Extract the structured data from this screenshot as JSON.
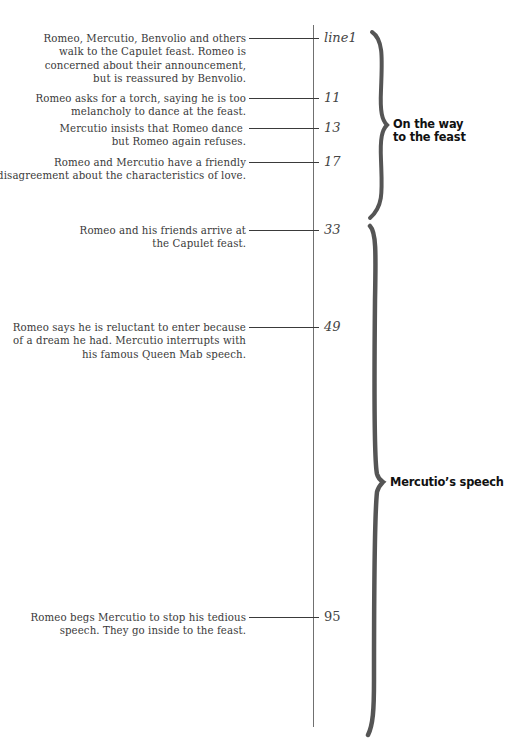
{
  "events": [
    {
      "line": "line1",
      "description": [
        "Romeo, Mercutio, Benvolio and others",
        "walk to the Capulet feast. Romeo is",
        "concerned about their announcement,",
        "but is reassured by Benvolio."
      ]
    },
    {
      "line": "11",
      "description": [
        "Romeo asks for a torch, saying he is too",
        "melancholy to dance at the feast."
      ]
    },
    {
      "line": "13",
      "description": [
        "Mercutio insists that Romeo dance",
        "but Romeo again refuses."
      ]
    },
    {
      "line": "17",
      "description": [
        "Romeo and Mercutio have a friendly",
        "disagreement about the characteristics of love."
      ]
    },
    {
      "line": "33",
      "description": [
        "Romeo and his friends arrive at",
        "the Capulet feast."
      ]
    },
    {
      "line": "49",
      "description": [
        "Romeo says he is reluctant to enter because",
        "of a dream he had. Mercutio interrupts with",
        "his famous Queen Mab speech."
      ]
    },
    {
      "line": "95",
      "description": [
        "Romeo begs Mercutio to stop his tedious",
        "speech. They go inside to the feast."
      ]
    }
  ],
  "sections": [
    {
      "label_lines": [
        "On the way",
        "to the feast"
      ],
      "from_line": "line1",
      "to_line": "17"
    },
    {
      "label_lines": [
        "Mercutio’s speech"
      ],
      "from_line": "33",
      "to_line": "95"
    }
  ],
  "colors": {
    "text": "#3a3a3a",
    "brace": "#555555",
    "axis": "#707070",
    "label": "#111111"
  }
}
